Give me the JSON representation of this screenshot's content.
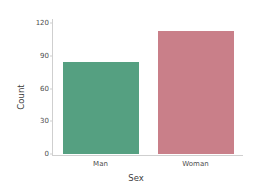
{
  "chart_data": {
    "type": "bar",
    "title": "",
    "subtitle": "",
    "xlabel": "Sex",
    "ylabel": "Count",
    "categories": [
      "Man",
      "Woman"
    ],
    "values": [
      84,
      113
    ],
    "series": [
      {
        "name": "Count",
        "values": [
          84,
          113
        ]
      }
    ],
    "colors": [
      "#55a081",
      "#c97f89"
    ],
    "ylim": [
      0,
      122
    ],
    "yticks": [
      0,
      30,
      60,
      90,
      120
    ],
    "ytick_labels": [
      "0",
      "30",
      "60",
      "90",
      "120"
    ],
    "xtick_labels": [
      "Man",
      "Woman"
    ],
    "grid": false,
    "legend": false,
    "legend_position": "none",
    "spines": {
      "left": true,
      "bottom": true,
      "top": false,
      "right": false,
      "color": "#cfcfcf"
    },
    "background": "#ffffff",
    "text_color": "#4d4d4d",
    "bar_width_fraction": 0.8
  }
}
